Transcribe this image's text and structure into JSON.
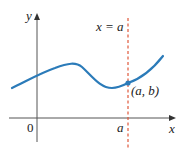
{
  "diagram": {
    "axes": {
      "x_label": "x",
      "y_label": "y",
      "origin_label": "0",
      "tick_label": "a"
    },
    "vertical_line": {
      "label": "x = a",
      "color": "#e0583a",
      "style": "dashed"
    },
    "curve": {
      "color": "#2b7bb9"
    },
    "point": {
      "label": "(a, b)",
      "color": "#2b7bb9"
    }
  }
}
